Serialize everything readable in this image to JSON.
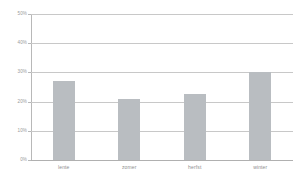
{
  "chart_data": {
    "type": "bar",
    "title": "",
    "subtitle": "",
    "xlabel": "",
    "ylabel": "",
    "categories": [
      "lente",
      "zomer",
      "herfst",
      "winter"
    ],
    "values": [
      27,
      21,
      22.5,
      30
    ],
    "ylim": [
      0,
      50
    ],
    "yticks": [
      0,
      10,
      20,
      30,
      40,
      50
    ],
    "ytick_labels": [
      "0%",
      "10%",
      "20%",
      "30%",
      "40%",
      "50%"
    ],
    "grid": true,
    "legend": false,
    "series": [
      {
        "name": "",
        "values": [
          27,
          21,
          22.5,
          30
        ]
      }
    ],
    "colors": {
      "bar": "#b9bdc1",
      "gridline": "#c8c8c8",
      "axis": "#b8b8b8",
      "tick_text": "#9a9a9a",
      "category_text": "#8e8e8e",
      "background": "#ffffff"
    }
  }
}
